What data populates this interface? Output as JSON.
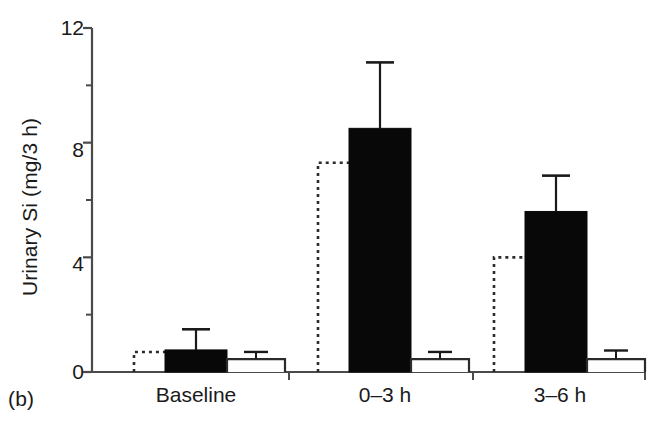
{
  "panel": {
    "label": "(b)"
  },
  "chart_data": {
    "type": "bar",
    "title": "",
    "xlabel": "",
    "ylabel": "Urinary Si (mg/3 h)",
    "categories": [
      "Baseline",
      "0–3 h",
      "3–6 h"
    ],
    "ylim": [
      0,
      12
    ],
    "yticks": [
      0,
      4,
      8,
      12
    ],
    "ytick_labels": [
      "0",
      "4",
      "8",
      "12"
    ],
    "yminor_ticks": [
      2,
      6,
      10
    ],
    "grid": false,
    "legend": "none",
    "series": [
      {
        "name": "dashed-outline",
        "style": "dashed-open",
        "values": [
          0.7,
          7.3,
          4.0
        ],
        "errors": [
          null,
          null,
          null
        ]
      },
      {
        "name": "solid-black",
        "style": "filled-black",
        "values": [
          0.77,
          8.5,
          5.6
        ],
        "errors": [
          0.72,
          2.3,
          1.25
        ]
      },
      {
        "name": "open-white",
        "style": "open-white",
        "values": [
          0.45,
          0.45,
          0.45
        ],
        "errors": [
          0.25,
          0.25,
          0.3
        ]
      }
    ]
  },
  "colors": {
    "axis": "#4a4a4a",
    "bar_black": "#080808",
    "bar_open_stroke": "#2b2b2b",
    "bar_open_fill": "#ffffff",
    "dashed_stroke": "#2b2b2b",
    "text": "#1a1a1a",
    "background": "#ffffff"
  },
  "geometry": {
    "plot_left": 92,
    "plot_right": 645,
    "baseline_y": 372,
    "top_y": 28,
    "group_centers": [
      196,
      380,
      556
    ],
    "bar_width": 62,
    "dashed_width": 62,
    "open_width": 58
  },
  "ytick_labels_list": [
    {
      "text": "12",
      "y": 28
    },
    {
      "text": "8",
      "y": 150
    },
    {
      "text": "4",
      "y": 264
    },
    {
      "text": "0",
      "y": 372
    }
  ],
  "xtick_labels_list": [
    {
      "text": "Baseline",
      "x": 196
    },
    {
      "text": "0–3 h",
      "x": 385
    },
    {
      "text": "3–6 h",
      "x": 560
    }
  ]
}
